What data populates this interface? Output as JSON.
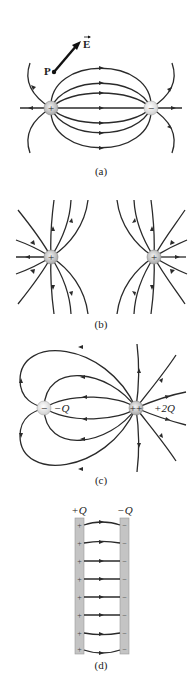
{
  "figure": {
    "panels": [
      {
        "id": "a",
        "caption": "(a)",
        "description": "Electric field lines of a dipole (positive and negative charge)",
        "charges": [
          {
            "sign": "+",
            "x": 51,
            "y": 108
          },
          {
            "sign": "−",
            "x": 151,
            "y": 108
          }
        ],
        "point_label": "P",
        "vector_label": "E⃗"
      },
      {
        "id": "b",
        "caption": "(b)",
        "description": "Electric field lines of two equal positive charges",
        "charges": [
          {
            "sign": "+",
            "x": 51,
            "y": 257
          },
          {
            "sign": "+",
            "x": 154,
            "y": 257
          }
        ]
      },
      {
        "id": "c",
        "caption": "(c)",
        "description": "Field lines of charges -Q and +2Q",
        "charges": [
          {
            "sign": "−",
            "label": "−Q",
            "x": 44,
            "y": 408
          },
          {
            "sign": "++",
            "label": "+2Q",
            "x": 136,
            "y": 408
          }
        ]
      },
      {
        "id": "d",
        "caption": "(d)",
        "description": "Parallel plate capacitor field",
        "plates": [
          {
            "label": "+Q",
            "sign": "+"
          },
          {
            "label": "−Q",
            "sign": "−"
          }
        ],
        "field_line_count": 8
      }
    ]
  }
}
